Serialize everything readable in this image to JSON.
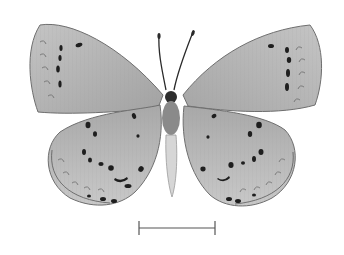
{
  "image": {
    "subject": "butterfly specimen (ventral view, wings spread)",
    "background_color": "#ffffff",
    "wing_color": "#b4b4b4",
    "wing_edge_color": "#6e6e6e",
    "spot_color": "#1e1e1e",
    "body_color": "#8a8a8a",
    "abdomen_color": "#d6d6d6"
  },
  "scale_bar": {
    "label": "",
    "color": "#555555",
    "x1": 139,
    "x2": 215,
    "y": 228
  }
}
